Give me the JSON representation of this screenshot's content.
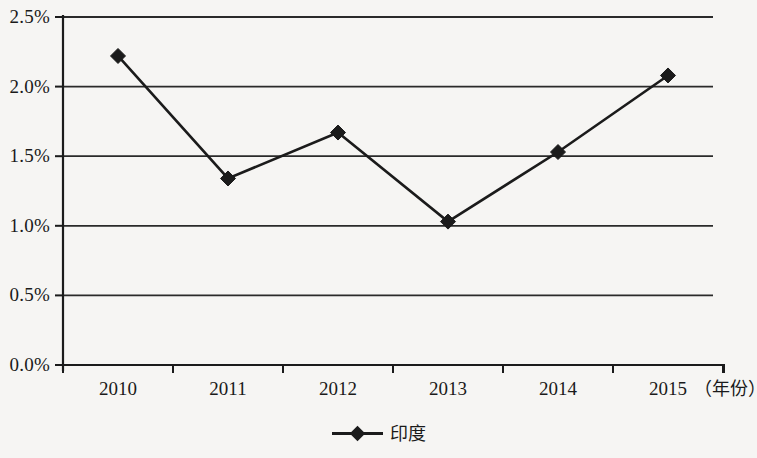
{
  "chart_data": {
    "type": "line",
    "title": "",
    "subtitle": "",
    "xlabel": "（年份）",
    "ylabel": "",
    "categories": [
      "2010",
      "2011",
      "2012",
      "2013",
      "2014",
      "2015"
    ],
    "series": [
      {
        "name": "印度",
        "values": [
          2.22,
          1.34,
          1.67,
          1.03,
          1.53,
          2.08
        ],
        "marker": "diamond",
        "color": "#1b1b1b"
      }
    ],
    "y_ticks": [
      "0.0%",
      "0.5%",
      "1.0%",
      "1.5%",
      "2.0%",
      "2.5%"
    ],
    "y_tick_values": [
      0.0,
      0.5,
      1.0,
      1.5,
      2.0,
      2.5
    ],
    "ylim": [
      0.0,
      2.5
    ],
    "grid": true,
    "grid_axis": "y",
    "legend": {
      "position": "bottom",
      "entries": [
        "印度"
      ]
    },
    "colors": {
      "background": "#f6f5f3",
      "axis": "#1b1b1b",
      "grid": "#2a2a2a",
      "series": "#1b1b1b"
    }
  },
  "axis": {
    "x_unit_note": "（年份）"
  },
  "legend": {
    "series_label": "印度"
  }
}
